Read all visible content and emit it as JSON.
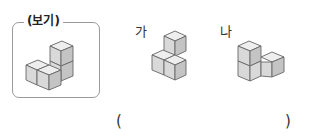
{
  "example": {
    "title": "(보기)"
  },
  "options": [
    {
      "label": "가"
    },
    {
      "label": "나"
    }
  ],
  "answer": {
    "open_paren": "(",
    "close_paren": ")"
  },
  "colors": {
    "cube_top": "#eeeeee",
    "cube_front": "#d9d9d9",
    "cube_side": "#c4c4c4",
    "stroke": "#666666"
  }
}
